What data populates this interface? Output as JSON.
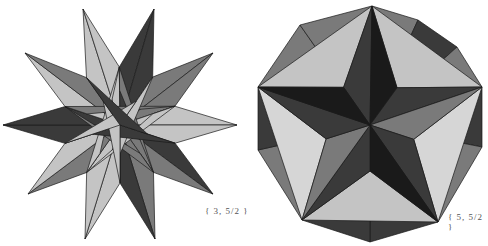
{
  "figures": [
    {
      "name": "great-icosahedron",
      "label": "{ 3, 5/2 }",
      "center": [
        120,
        125
      ],
      "tips": [
        [
          83,
          9
        ],
        [
          154,
          9
        ],
        [
          213,
          53
        ],
        [
          237,
          125
        ],
        [
          213,
          194
        ],
        [
          155,
          239
        ],
        [
          85,
          239
        ],
        [
          28,
          194
        ],
        [
          3,
          125
        ],
        [
          25,
          53
        ]
      ],
      "inner_radius": 58
    },
    {
      "name": "great-dodecahedron",
      "label": "{ 5, 5/2 }",
      "center": [
        370,
        125
      ],
      "outline": [
        [
          372,
          6
        ],
        [
          418,
          20
        ],
        [
          457,
          47
        ],
        [
          482,
          87
        ],
        [
          482,
          147
        ],
        [
          438,
          222
        ],
        [
          370,
          242
        ],
        [
          302,
          220
        ],
        [
          258,
          150
        ],
        [
          258,
          87
        ],
        [
          300,
          25
        ]
      ],
      "star_tips": [
        [
          372,
          6
        ],
        [
          482,
          87
        ],
        [
          438,
          222
        ],
        [
          302,
          220
        ],
        [
          258,
          87
        ]
      ],
      "star_inner_radius": 46
    }
  ],
  "colors": {
    "ink": "#1a1a1a",
    "dark": "#3a3a3a",
    "mid": "#7a7a7a",
    "light": "#c4c4c4",
    "paper": "#ffffff"
  }
}
